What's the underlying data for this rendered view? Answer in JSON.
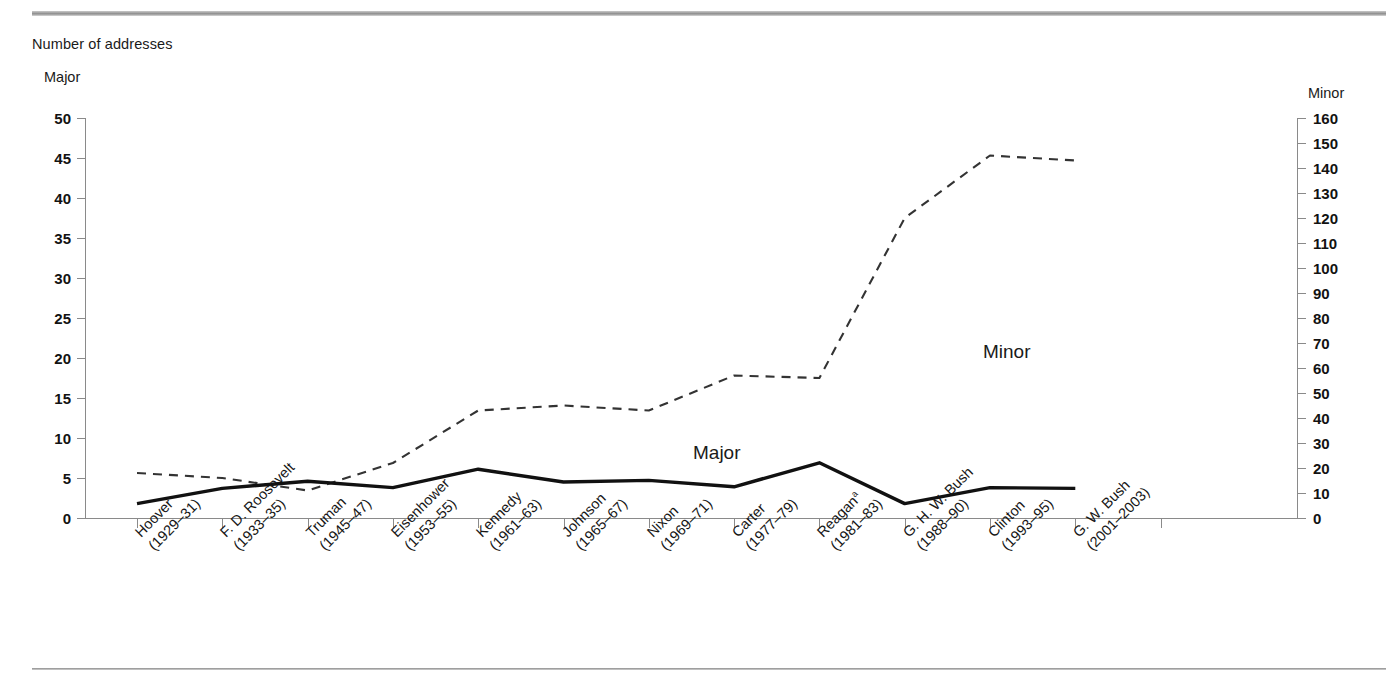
{
  "figure": {
    "units_label": "Number of addresses",
    "left_axis_title": "Major",
    "right_axis_title": "Minor",
    "series_label_major": "Major",
    "series_label_minor": "Minor",
    "reagan_footnote_marker": "a"
  },
  "chart_data": {
    "type": "line",
    "title": "Number of addresses",
    "xlabel": "",
    "ylabel": "Major",
    "y2label": "Minor",
    "ylim": [
      0,
      50
    ],
    "y2lim": [
      0,
      160
    ],
    "yticks": [
      0,
      5,
      10,
      15,
      20,
      25,
      30,
      35,
      40,
      45,
      50
    ],
    "y2ticks": [
      0,
      10,
      20,
      30,
      40,
      50,
      60,
      70,
      80,
      90,
      100,
      110,
      120,
      130,
      140,
      150,
      160
    ],
    "grid": false,
    "legend": "inline-annotations",
    "categories": [
      "Hoover (1929–31)",
      "F. D. Roosevelt (1933–35)",
      "Truman (1945–47)",
      "Eisenhower (1953–55)",
      "Kennedy (1961–63)",
      "Johnson (1965–67)",
      "Nixon (1969–71)",
      "Carter (1977–79)",
      "Reagan (1981–83)",
      "G. H. W. Bush (1988–90)",
      "Clinton (1993–95)",
      "G. W. Bush (2001–2003)"
    ],
    "category_lines": [
      {
        "name": "Hoover",
        "years": "(1929–31)"
      },
      {
        "name": "F. D. Roosevelt",
        "years": "(1933–35)"
      },
      {
        "name": "Truman",
        "years": "(1945–47)"
      },
      {
        "name": "Eisenhower",
        "years": "(1953–55)"
      },
      {
        "name": "Kennedy",
        "years": "(1961–63)"
      },
      {
        "name": "Johnson",
        "years": "(1965–67)"
      },
      {
        "name": "Nixon",
        "years": "(1969–71)"
      },
      {
        "name": "Carter",
        "years": "(1977–79)"
      },
      {
        "name": "Reagan",
        "years": "(1981–83)",
        "footnote": "a"
      },
      {
        "name": "G. H. W. Bush",
        "years": "(1988–90)"
      },
      {
        "name": "Clinton",
        "years": "(1993–95)"
      },
      {
        "name": "G. W. Bush",
        "years": "(2001–2003)"
      }
    ],
    "series": [
      {
        "name": "Major",
        "axis": "left",
        "style": "solid",
        "color": "#111111",
        "values": [
          1.8,
          3.7,
          4.6,
          3.8,
          6.1,
          4.5,
          4.7,
          3.9,
          6.9,
          1.8,
          3.8,
          3.7
        ]
      },
      {
        "name": "Minor",
        "axis": "right",
        "style": "dashed",
        "color": "#333333",
        "values": [
          18,
          16,
          11,
          22,
          43,
          45,
          43,
          57,
          56,
          120,
          145,
          143
        ]
      }
    ]
  }
}
